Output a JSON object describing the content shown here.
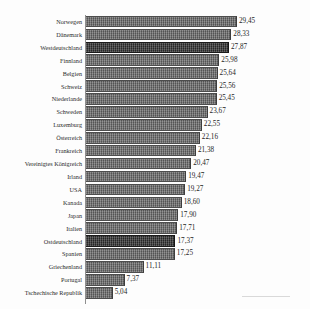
{
  "chart_data": {
    "type": "bar",
    "orientation": "horizontal",
    "title": "",
    "subtitle": "",
    "xlabel": "",
    "ylabel": "",
    "decimal_separator": ",",
    "grid": false,
    "legend": "none",
    "xlim": [
      0,
      29.45
    ],
    "categories": [
      "Norwegen",
      "Dänemark",
      "Westdeutschland",
      "Finnland",
      "Belgien",
      "Schweiz",
      "Niederlande",
      "Schweden",
      "Luxemburg",
      "Österreich",
      "Frankreich",
      "Vereinigtes Königreich",
      "Irland",
      "USA",
      "Kanada",
      "Japan",
      "Italien",
      "Ostdeutschland",
      "Spanien",
      "Griechenland",
      "Portugal",
      "Tschechische Republik"
    ],
    "values": [
      29.45,
      28.33,
      27.87,
      25.98,
      25.64,
      25.56,
      25.45,
      23.67,
      22.55,
      22.16,
      21.38,
      20.47,
      19.47,
      19.27,
      18.6,
      17.9,
      17.71,
      17.37,
      17.25,
      11.11,
      7.37,
      5.04
    ],
    "value_labels": [
      "29,45",
      "28,33",
      "27,87",
      "25,98",
      "25,64",
      "25,56",
      "25,45",
      "23,67",
      "22,55",
      "22,16",
      "21,38",
      "20,47",
      "19,47",
      "19,27",
      "18,60",
      "17,90",
      "17,71",
      "17,37",
      "17,25",
      "11,11",
      "7,37",
      "5,04"
    ],
    "highlighted_categories": [
      "Westdeutschland",
      "Ostdeutschland"
    ],
    "colors": {
      "bar": "#6e6e6e",
      "bar_highlight": "#333333",
      "axis": "#8f8f8f",
      "text": "#1f1f1f",
      "background": "#fdfdfd"
    }
  }
}
